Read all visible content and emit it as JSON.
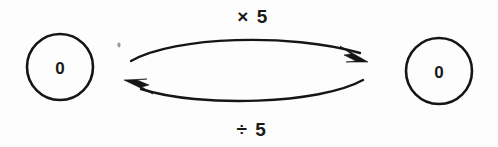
{
  "diagram": {
    "type": "state-transition",
    "background_color": "#fdfdfd",
    "ink_color": "#151515",
    "text_color": "#1a1a1a",
    "nodes": [
      {
        "id": "left-node",
        "label": "0",
        "cx": 60,
        "cy": 67,
        "r": 33
      },
      {
        "id": "right-node",
        "label": "0",
        "cx": 439,
        "cy": 71,
        "r": 33
      }
    ],
    "edges": [
      {
        "id": "forward-edge",
        "label": "× 5",
        "from": "left-node",
        "to": "right-node",
        "direction": "left-to-right",
        "curve": "arc-up",
        "label_x": 253,
        "label_y": 16
      },
      {
        "id": "reverse-edge",
        "label": "÷ 5",
        "from": "right-node",
        "to": "left-node",
        "direction": "right-to-left",
        "curve": "arc-down",
        "label_x": 252,
        "label_y": 129
      }
    ]
  }
}
